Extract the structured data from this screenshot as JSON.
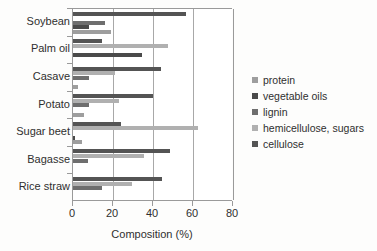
{
  "chart_data": {
    "type": "bar",
    "orientation": "horizontal",
    "title": "",
    "xlabel": "Composition (%)",
    "ylabel": "",
    "xlim": [
      0,
      80
    ],
    "xticks": [
      0,
      20,
      40,
      60,
      80
    ],
    "xtick_labels": [
      "0",
      "20",
      "40",
      "60",
      "80"
    ],
    "grid": true,
    "grid_axis": "x",
    "legend_position": "right",
    "categories": [
      "Soybean",
      "Palm oil",
      "Casave",
      "Potato",
      "Sugar beet",
      "Bagasse",
      "Rice straw"
    ],
    "series": [
      {
        "name": "protein",
        "color": "#9e9e9e",
        "values": [
          19.0,
          0.0,
          2.5,
          5.5,
          4.5,
          0.0,
          0.0
        ]
      },
      {
        "name": "vegetable oils",
        "color": "#4a4a4a",
        "values": [
          8.0,
          34.5,
          0.0,
          0.0,
          0.8,
          0.0,
          0.0
        ]
      },
      {
        "name": "lignin",
        "color": "#6e6e6e",
        "values": [
          16.0,
          0.0,
          8.0,
          8.0,
          0.0,
          7.5,
          14.5
        ]
      },
      {
        "name": "hemicellulose, sugars",
        "color": "#b0b0b0",
        "values": [
          0.0,
          47.5,
          21.0,
          23.0,
          62.5,
          35.5,
          29.5
        ]
      },
      {
        "name": "cellulose",
        "color": "#545454",
        "values": [
          56.5,
          14.5,
          44.0,
          40.0,
          24.0,
          48.5,
          44.5
        ]
      }
    ]
  },
  "legend": {
    "items": [
      {
        "label": "protein",
        "color": "#9e9e9e"
      },
      {
        "label": "vegetable oils",
        "color": "#4a4a4a"
      },
      {
        "label": "lignin",
        "color": "#6e6e6e"
      },
      {
        "label": "hemicellulose, sugars",
        "color": "#b0b0b0"
      },
      {
        "label": "cellulose",
        "color": "#545454"
      }
    ]
  }
}
